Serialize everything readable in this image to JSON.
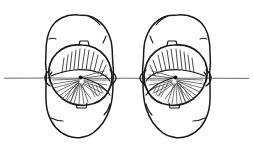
{
  "figure": {
    "title": "Paired mirror-image specimen outlines with axis of symmetry",
    "caption": "",
    "background_color": "#ffffff",
    "ink_color": "#1a1a1a",
    "axis_color": "#6b6b6b",
    "width": 253,
    "height": 151,
    "style": "pen-and-ink scientific line drawing"
  },
  "axis": {
    "name": "axis-of-symmetry",
    "orientation": "horizontal",
    "y": 78,
    "x_start": 4,
    "x_end": 249,
    "color": "#6b6b6b",
    "label": ""
  },
  "specimens": [
    {
      "id": "left-specimen",
      "name": "Left specimen",
      "chirality": "left",
      "outer_body": {
        "name": "outer-body-outline",
        "center_x": 80,
        "center_y": 76,
        "width": 68,
        "height": 122,
        "shape": "elongate rounded ovoid"
      },
      "inner_shell": {
        "name": "inner-shell-outline",
        "center_x": 80,
        "center_y": 76,
        "width": 62,
        "height": 62,
        "shape": "subcircular valve"
      },
      "umbo": {
        "name": "umbo-point",
        "x": 80,
        "y": 77
      },
      "divide": {
        "name": "valve-commissure",
        "description": "curved line separating upper and lower rib fans"
      },
      "rib_fans": [
        {
          "name": "upper-rib-fan",
          "count": 11,
          "direction": "upper-left to upper-right"
        },
        {
          "name": "lower-rib-fan",
          "count": 14,
          "direction": "radiating lower"
        },
        {
          "name": "right-rib-fan",
          "count": 13,
          "direction": "radiating right"
        }
      ],
      "notches": [
        {
          "name": "dorsal-notch",
          "x": 84,
          "y": 44
        },
        {
          "name": "ventral-notch",
          "x": 82,
          "y": 106
        }
      ]
    },
    {
      "id": "right-specimen",
      "name": "Right specimen",
      "chirality": "right",
      "outer_body": {
        "name": "outer-body-outline",
        "center_x": 176,
        "center_y": 76,
        "width": 68,
        "height": 122,
        "shape": "elongate rounded ovoid"
      },
      "inner_shell": {
        "name": "inner-shell-outline",
        "center_x": 176,
        "center_y": 76,
        "width": 62,
        "height": 62,
        "shape": "subcircular valve"
      },
      "umbo": {
        "name": "umbo-point",
        "x": 176,
        "y": 77
      },
      "divide": {
        "name": "valve-commissure",
        "description": "curved line separating upper and lower rib fans"
      },
      "rib_fans": [
        {
          "name": "upper-rib-fan",
          "count": 11,
          "direction": "upper-right to upper-left"
        },
        {
          "name": "lower-rib-fan",
          "count": 14,
          "direction": "radiating lower"
        },
        {
          "name": "left-rib-fan",
          "count": 13,
          "direction": "radiating left"
        }
      ],
      "notches": [
        {
          "name": "dorsal-notch",
          "x": 172,
          "y": 44
        },
        {
          "name": "ventral-notch",
          "x": 174,
          "y": 106
        }
      ]
    }
  ]
}
